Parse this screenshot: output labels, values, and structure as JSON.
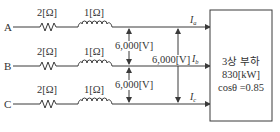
{
  "diagram": {
    "type": "three-phase-circuit",
    "lines": [
      {
        "node": "A",
        "resistance": "2[Ω]",
        "reactance": "1[Ω]",
        "current_main": "I",
        "current_sub": "a"
      },
      {
        "node": "B",
        "resistance": "2[Ω]",
        "reactance": "1[Ω]",
        "current_main": "I",
        "current_sub": "b"
      },
      {
        "node": "C",
        "resistance": "2[Ω]",
        "reactance": "1[Ω]",
        "current_main": "I",
        "current_sub": "c"
      }
    ],
    "voltages": {
      "ab": "6,000[V]",
      "bc": "6,000[V]",
      "ac": "6,000[V]"
    },
    "load": {
      "title": "3상 부하",
      "power": "830[kW]",
      "power_factor": "cosθ =0.85"
    },
    "colors": {
      "line": "#3a3a3a",
      "text": "#333333",
      "background": "#ffffff"
    }
  }
}
